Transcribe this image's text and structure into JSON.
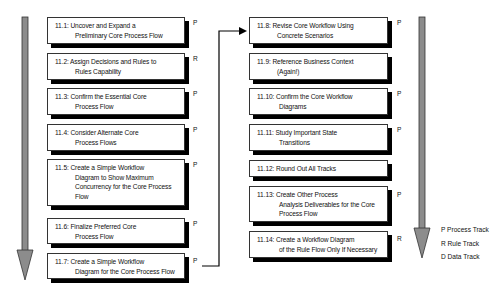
{
  "diagram": {
    "left_column": [
      {
        "id": "11.1",
        "lines": [
          "11.1: Uncover and Expand a",
          "Preliminary Core Process Flow"
        ],
        "track": "P"
      },
      {
        "id": "11.2",
        "lines": [
          "11.2: Assign Decisions and Rules to",
          "Rules Capability"
        ],
        "track": "R"
      },
      {
        "id": "11.3",
        "lines": [
          "11.3: Confirm the Essential Core",
          "Process Flow"
        ],
        "track": "P"
      },
      {
        "id": "11.4",
        "lines": [
          "11.4: Consider Alternate Core",
          "Process Flows"
        ],
        "track": "P"
      },
      {
        "id": "11.5",
        "lines": [
          "11.5: Create a Simple Workflow",
          "Diagram to Show Maximum",
          "Concurrency for the Core Process",
          "Flow"
        ],
        "track": "P"
      },
      {
        "id": "11.6",
        "lines": [
          "11.6: Finalize Preferred Core",
          "Process Flow"
        ],
        "track": "P"
      },
      {
        "id": "11.7",
        "lines": [
          "11.7: Create a Simple Workflow",
          "Diagram for the Core Process Flow"
        ],
        "track": "P"
      }
    ],
    "right_column": [
      {
        "id": "11.8",
        "lines": [
          "11.8: Revise Core Workflow Using",
          "Concrete Scenarios"
        ],
        "track": "P"
      },
      {
        "id": "11.9",
        "lines": [
          "11.9: Reference Business Context",
          "(Again!)"
        ],
        "track": ""
      },
      {
        "id": "11.10",
        "lines": [
          "11.10: Confirm the Core Workflow",
          "Diagrams"
        ],
        "track": "P"
      },
      {
        "id": "11.11",
        "lines": [
          "11.11: Study Important State",
          "Transitions"
        ],
        "track": "P"
      },
      {
        "id": "11.12",
        "lines": [
          "11.12: Round Out All Tracks"
        ],
        "track": ""
      },
      {
        "id": "11.13",
        "lines": [
          "11.13: Create Other Process",
          "Analysis Deliverables for the Core",
          "Process Flow"
        ],
        "track": "P"
      },
      {
        "id": "11.14",
        "lines": [
          "11.14: Create a Workflow Diagram",
          "of the Rule Flow Only If Necessary"
        ],
        "track": "R"
      }
    ],
    "legend": [
      "P Process Track",
      "R Rule Track",
      "D Data Track"
    ],
    "colors": {
      "arrow_fill": "#8c8c8c",
      "arrow_outline": "#333333",
      "box_shadow": "#000000",
      "connector": "#000000"
    }
  }
}
